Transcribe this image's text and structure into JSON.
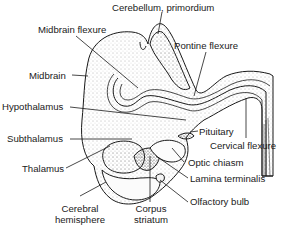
{
  "figure": {
    "colors": {
      "ink": "#1a1a1a",
      "background": "#ffffff",
      "stipple": "#555555"
    },
    "labels": {
      "cerebellum": "Cerebellum, primordium",
      "midbrain_flexure": "Midbrain flexure",
      "pontine_flexure": "Pontine flexure",
      "midbrain": "Midbrain",
      "hypothalamus": "Hypothalamus",
      "pituitary": "Pituitary",
      "cervical_flexure": "Cervical flexure",
      "subthalamus": "Subthalamus",
      "optic_chiasm": "Optic chiasm",
      "thalamus": "Thalamus",
      "lamina_terminalis": "Lamina terminalis",
      "olfactory_bulb": "Olfactory bulb",
      "cerebral_hemisphere_1": "Cerebral",
      "cerebral_hemisphere_2": "hemisphere",
      "corpus_striatum_1": "Corpus",
      "corpus_striatum_2": "striatum"
    }
  }
}
